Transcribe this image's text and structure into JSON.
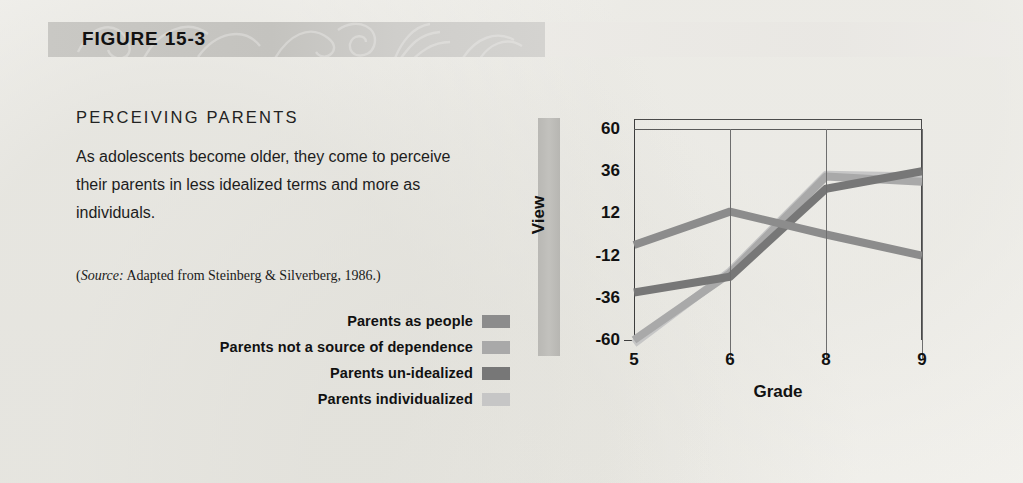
{
  "figure": {
    "label": "FIGURE 15-3",
    "subhead": "PERCEIVING PARENTS",
    "blurb": "As adolescents become older, they come to perceive their parents in less idealized terms and more as individuals.",
    "source_prefix": "(",
    "source_italic": "Source:",
    "source_rest": " Adapted from Steinberg & Silverberg, 1986.)"
  },
  "legend": {
    "items": [
      {
        "label": "Parents as people",
        "color": "#8c8c8c"
      },
      {
        "label": "Parents not a source of dependence",
        "color": "#a9a9a9"
      },
      {
        "label": "Parents un-idealized",
        "color": "#777777"
      },
      {
        "label": "Parents individualized",
        "color": "#c6c6c6"
      }
    ]
  },
  "chart_data": {
    "type": "line",
    "title": "Perceiving Parents",
    "xlabel": "Grade",
    "ylabel": "View",
    "categories": [
      "5",
      "6",
      "8",
      "9"
    ],
    "x": [
      5,
      6,
      8,
      9
    ],
    "xtick_labels": [
      "5",
      "6",
      "8",
      "9"
    ],
    "ytick_labels": [
      "60",
      "36",
      "12",
      "-12",
      "-36",
      "-60"
    ],
    "yticks": [
      60,
      36,
      12,
      -12,
      -36,
      -60
    ],
    "ylim": [
      -60,
      60
    ],
    "grid": "vertical",
    "legend_position": "left-panel",
    "series": [
      {
        "name": "Parents as people",
        "color": "#8c8c8c",
        "values": [
          -6,
          13,
          0,
          -12
        ]
      },
      {
        "name": "Parents not a source of dependence",
        "color": "#a9a9a9",
        "values": [
          -60,
          -22,
          33,
          30
        ]
      },
      {
        "name": "Parents un-idealized",
        "color": "#777777",
        "values": [
          -33,
          -24,
          26,
          36
        ]
      },
      {
        "name": "Parents individualized",
        "color": "#c6c6c6",
        "values": [
          -62,
          -21,
          34,
          33
        ]
      }
    ]
  }
}
